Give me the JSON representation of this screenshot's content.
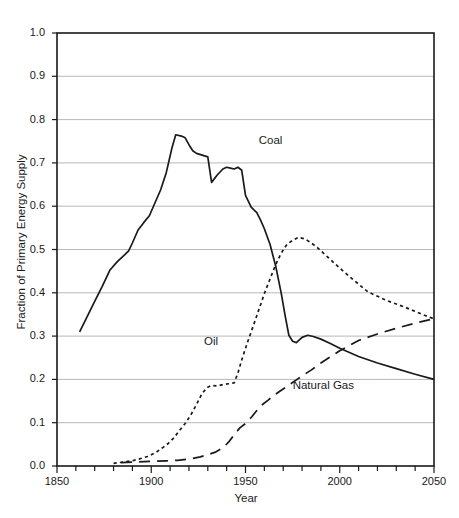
{
  "chart_data": {
    "type": "line",
    "title": "",
    "xlabel": "Year",
    "ylabel": "Fraction of Primary Energy Supply",
    "xlim": [
      1850,
      2050
    ],
    "ylim": [
      0.0,
      1.0
    ],
    "grid": "horizontal",
    "legend_position": "inline-annotations",
    "xticks": [
      1850,
      1900,
      1950,
      2000,
      2050
    ],
    "xtick_labels": [
      "1850",
      "1900",
      "1950",
      "2000",
      "2050"
    ],
    "xminor_step": 10,
    "yticks": [
      0.0,
      0.1,
      0.2,
      0.3,
      0.4,
      0.5,
      0.6,
      0.7,
      0.8,
      0.9,
      1.0
    ],
    "ytick_labels": [
      "0.0",
      "0.1",
      "0.2",
      "0.3",
      "0.4",
      "0.5",
      "0.6",
      "0.7",
      "0.8",
      "0.9",
      "1.0"
    ],
    "series": [
      {
        "name": "Coal",
        "style": "solid",
        "color": "#1a1a1a",
        "label_x": 1957,
        "label_y": 0.748,
        "x": [
          1862,
          1866,
          1870,
          1874,
          1878,
          1882,
          1886,
          1888,
          1890,
          1893,
          1896,
          1899,
          1902,
          1905,
          1908,
          1911,
          1913,
          1916,
          1918,
          1920,
          1922,
          1924,
          1927,
          1930,
          1932,
          1935,
          1938,
          1940,
          1942,
          1944,
          1946,
          1948,
          1950,
          1953,
          1956,
          1958,
          1960,
          1963,
          1966,
          1969,
          1971,
          1973,
          1975,
          1977,
          1980,
          1983,
          1986,
          1990,
          1995,
          2000,
          2010,
          2020,
          2030,
          2040,
          2050
        ],
        "y": [
          0.31,
          0.345,
          0.38,
          0.415,
          0.452,
          0.472,
          0.488,
          0.497,
          0.515,
          0.545,
          0.562,
          0.578,
          0.608,
          0.638,
          0.678,
          0.735,
          0.765,
          0.762,
          0.758,
          0.742,
          0.728,
          0.722,
          0.718,
          0.714,
          0.655,
          0.672,
          0.686,
          0.69,
          0.688,
          0.686,
          0.69,
          0.683,
          0.625,
          0.598,
          0.585,
          0.568,
          0.548,
          0.512,
          0.462,
          0.398,
          0.348,
          0.302,
          0.288,
          0.285,
          0.297,
          0.302,
          0.299,
          0.293,
          0.283,
          0.272,
          0.253,
          0.238,
          0.225,
          0.212,
          0.2
        ]
      },
      {
        "name": "Oil",
        "style": "dotted",
        "color": "#1a1a1a",
        "label_x": 1928,
        "label_y": 0.285,
        "x": [
          1880,
          1885,
          1890,
          1895,
          1898,
          1900,
          1903,
          1906,
          1909,
          1912,
          1915,
          1918,
          1921,
          1924,
          1927,
          1930,
          1932,
          1935,
          1938,
          1941,
          1944,
          1946,
          1948,
          1951,
          1954,
          1957,
          1960,
          1963,
          1966,
          1969,
          1972,
          1975,
          1978,
          1981,
          1984,
          1988,
          1993,
          1998,
          2005,
          2015,
          2025,
          2035,
          2045,
          2050
        ],
        "y": [
          0.006,
          0.009,
          0.012,
          0.018,
          0.022,
          0.026,
          0.033,
          0.042,
          0.052,
          0.065,
          0.082,
          0.098,
          0.118,
          0.142,
          0.168,
          0.182,
          0.186,
          0.185,
          0.188,
          0.19,
          0.192,
          0.215,
          0.245,
          0.285,
          0.322,
          0.36,
          0.398,
          0.432,
          0.465,
          0.492,
          0.512,
          0.521,
          0.528,
          0.525,
          0.518,
          0.505,
          0.485,
          0.465,
          0.438,
          0.402,
          0.382,
          0.366,
          0.348,
          0.34
        ]
      },
      {
        "name": "Natural Gas",
        "style": "dashed",
        "color": "#1a1a1a",
        "label_x": 1975,
        "label_y": 0.182,
        "x": [
          1884,
          1890,
          1896,
          1902,
          1908,
          1914,
          1920,
          1926,
          1930,
          1934,
          1938,
          1941,
          1944,
          1947,
          1950,
          1953,
          1956,
          1959,
          1962,
          1965,
          1968,
          1972,
          1976,
          1980,
          1985,
          1990,
          1995,
          2000,
          2010,
          2020,
          2030,
          2040,
          2050
        ],
        "y": [
          0.008,
          0.009,
          0.01,
          0.011,
          0.012,
          0.013,
          0.016,
          0.021,
          0.026,
          0.032,
          0.042,
          0.055,
          0.072,
          0.088,
          0.098,
          0.112,
          0.128,
          0.142,
          0.152,
          0.163,
          0.172,
          0.184,
          0.196,
          0.208,
          0.222,
          0.238,
          0.252,
          0.266,
          0.29,
          0.305,
          0.318,
          0.33,
          0.34
        ]
      }
    ]
  }
}
